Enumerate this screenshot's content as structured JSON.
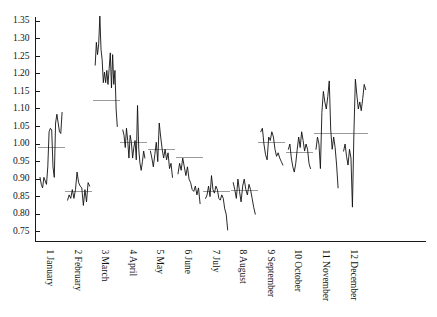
{
  "chart_data": {
    "type": "line",
    "title": "",
    "subtitle": "",
    "xlabel": "",
    "ylabel": "",
    "grid": false,
    "legend": "none",
    "xlim": [
      0,
      12
    ],
    "ylim": [
      0.73,
      1.37
    ],
    "ytick_labels": [
      "1.35",
      "1.30",
      "1.25",
      "1.20",
      "1.15",
      "1.10",
      "1.05",
      "1.00",
      "0.95",
      "0.90",
      "0.85",
      "0.80",
      "0.75"
    ],
    "ytick_values": [
      1.35,
      1.3,
      1.25,
      1.2,
      1.15,
      1.1,
      1.05,
      1.0,
      0.95,
      0.9,
      0.85,
      0.8,
      0.75
    ],
    "xtick_labels": [
      "1 January",
      "2 February",
      "3 March",
      "4 April",
      "5 May",
      "6 June",
      "7 July",
      "8 August",
      "9 September",
      "10 October",
      "11 November",
      "12 December"
    ],
    "categories": [
      "1 January",
      "2 February",
      "3 March",
      "4 April",
      "5 May",
      "6 June",
      "7 July",
      "8 August",
      "9 September",
      "10 October",
      "11 November",
      "12 December"
    ],
    "series": [
      {
        "name": "observations",
        "color": "#111111",
        "segments": [
          {
            "group": "1 January",
            "mean": 0.99,
            "values": [
              0.905,
              0.885,
              0.875,
              0.905,
              0.895,
              0.885,
              0.935,
              1.035,
              1.045,
              1.04,
              0.935,
              0.905,
              1.06,
              1.085,
              1.06,
              1.035,
              1.03,
              1.09
            ]
          },
          {
            "group": "2 February",
            "mean": 0.866,
            "values": [
              0.84,
              0.855,
              0.845,
              0.87,
              0.845,
              0.87,
              0.92,
              0.89,
              0.88,
              0.875,
              0.825,
              0.87,
              0.835,
              0.89,
              0.88
            ]
          },
          {
            "group": "3 March",
            "mean": 1.125,
            "values": [
              1.225,
              1.29,
              1.255,
              1.285,
              1.365,
              1.27,
              1.24,
              1.175,
              1.205,
              1.175,
              1.21,
              1.17,
              1.215,
              1.26,
              1.16,
              1.255,
              1.17,
              1.21,
              1.1,
              1.05
            ]
          },
          {
            "group": "4 April",
            "mean": 1.005,
            "values": [
              1.04,
              1.025,
              0.99,
              1.045,
              1.01,
              0.96,
              1.025,
              1.005,
              0.96,
              0.99,
              1.01,
              0.955,
              1.11,
              0.985,
              0.945,
              0.925,
              0.95,
              0.98,
              0.96
            ]
          },
          {
            "group": "5 May",
            "mean": 0.985,
            "values": [
              0.98,
              0.96,
              0.935,
              0.97,
              1.005,
              0.95,
              1.06,
              1.02,
              0.985,
              0.96,
              0.985,
              0.955,
              0.975,
              0.93,
              0.945,
              0.905
            ]
          },
          {
            "group": "6 June",
            "mean": 0.962,
            "values": [
              0.915,
              0.945,
              0.925,
              0.96,
              0.935,
              0.91,
              0.935,
              0.9,
              0.89,
              0.87,
              0.865,
              0.88,
              0.855,
              0.875,
              0.83
            ]
          },
          {
            "group": "7 July",
            "mean": 0.865,
            "values": [
              0.845,
              0.855,
              0.88,
              0.85,
              0.91,
              0.87,
              0.86,
              0.88,
              0.87,
              0.845,
              0.84,
              0.855,
              0.845,
              0.815,
              0.8,
              0.755
            ]
          },
          {
            "group": "8 August",
            "mean": 0.868,
            "values": [
              0.89,
              0.87,
              0.845,
              0.9,
              0.865,
              0.835,
              0.88,
              0.9,
              0.87,
              0.855,
              0.885,
              0.87,
              0.845,
              0.82,
              0.8
            ]
          },
          {
            "group": "9 September",
            "mean": 1.005,
            "values": [
              1.035,
              1.045,
              1.0,
              0.97,
              0.955,
              1.02,
              1.01,
              1.035,
              1.02,
              0.985,
              0.965,
              0.975,
              0.96,
              0.95,
              0.94
            ]
          },
          {
            "group": "10 October",
            "mean": 0.975,
            "values": [
              0.985,
              1.0,
              0.96,
              0.935,
              0.92,
              0.945,
              0.985,
              1.02,
              0.99,
              1.035,
              1.01,
              0.98,
              1.0,
              0.985,
              0.945,
              0.93
            ]
          },
          {
            "group": "11 November",
            "mean": 1.03,
            "values": [
              0.985,
              1.02,
              1.0,
              0.93,
              1.09,
              1.15,
              1.12,
              1.1,
              1.135,
              1.18,
              1.04,
              0.985,
              1.02,
              0.99,
              0.94,
              0.875
            ]
          },
          {
            "group": "12 December",
            "mean": 1.03,
            "values": [
              0.98,
              1.0,
              0.965,
              0.94,
              0.985,
              0.96,
              0.82,
              1.03,
              1.185,
              1.14,
              1.1,
              1.12,
              1.095,
              1.13,
              1.17,
              1.155
            ]
          }
        ]
      }
    ]
  }
}
